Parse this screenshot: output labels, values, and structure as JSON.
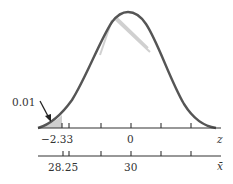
{
  "diagram": {
    "type": "normal-distribution",
    "tail_area_label": "0.01",
    "z_axis": {
      "symbol": "z",
      "labels": [
        {
          "value": "−2.33"
        },
        {
          "value": "0"
        }
      ]
    },
    "xbar_axis": {
      "symbol": "x̄",
      "labels": [
        {
          "value": "28.25"
        },
        {
          "value": "30"
        }
      ]
    },
    "colors": {
      "curve": "#555555",
      "shade": "#c8c8c8",
      "axis": "#333333"
    }
  }
}
